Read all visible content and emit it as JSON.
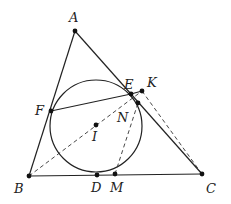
{
  "diagram": {
    "type": "geometry",
    "points": {
      "A": {
        "label": "A",
        "x": 75,
        "y": 31,
        "lx": 69,
        "ly": 22
      },
      "B": {
        "label": "B",
        "x": 29,
        "y": 176,
        "lx": 14,
        "ly": 193
      },
      "C": {
        "label": "C",
        "x": 202,
        "y": 174,
        "lx": 206,
        "ly": 193
      },
      "D": {
        "label": "D",
        "x": 97,
        "y": 175,
        "lx": 91,
        "ly": 192
      },
      "M": {
        "label": "M",
        "x": 115,
        "y": 174,
        "lx": 110,
        "ly": 192
      },
      "E": {
        "label": "E",
        "x": 131,
        "y": 94,
        "lx": 124,
        "ly": 89
      },
      "K": {
        "label": "K",
        "x": 142,
        "y": 91,
        "lx": 147,
        "ly": 87
      },
      "N": {
        "label": "N",
        "x": 138,
        "y": 103,
        "lx": 117,
        "ly": 122
      },
      "F": {
        "label": "F",
        "x": 51,
        "y": 111,
        "lx": 35,
        "ly": 115
      },
      "I": {
        "label": "I",
        "x": 96,
        "y": 125,
        "lx": 92,
        "ly": 141
      }
    },
    "incircle": {
      "cx": 96,
      "cy": 126,
      "r": 46
    },
    "solid_segments": [
      [
        "A",
        "B"
      ],
      [
        "B",
        "C"
      ],
      [
        "A",
        "C"
      ],
      [
        "F",
        "E"
      ],
      [
        "E",
        "K"
      ]
    ],
    "dashed_segments": [
      [
        "B",
        "K"
      ],
      [
        "K",
        "C"
      ],
      [
        "M",
        "N"
      ]
    ]
  }
}
